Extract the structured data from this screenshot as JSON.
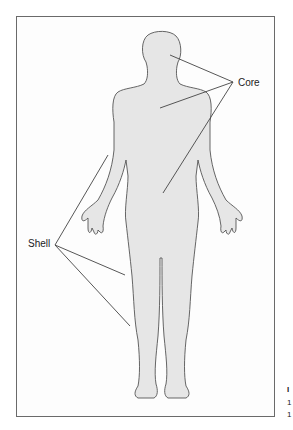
{
  "diagram": {
    "labels": {
      "core": "Core",
      "shell": "Shell"
    },
    "caption_fragments": [
      "I",
      "1",
      "1"
    ],
    "colors": {
      "body_fill": "#e6e6e6",
      "outline": "#555555",
      "leader_line": "#444444",
      "frame": "#6a6a6a"
    }
  }
}
